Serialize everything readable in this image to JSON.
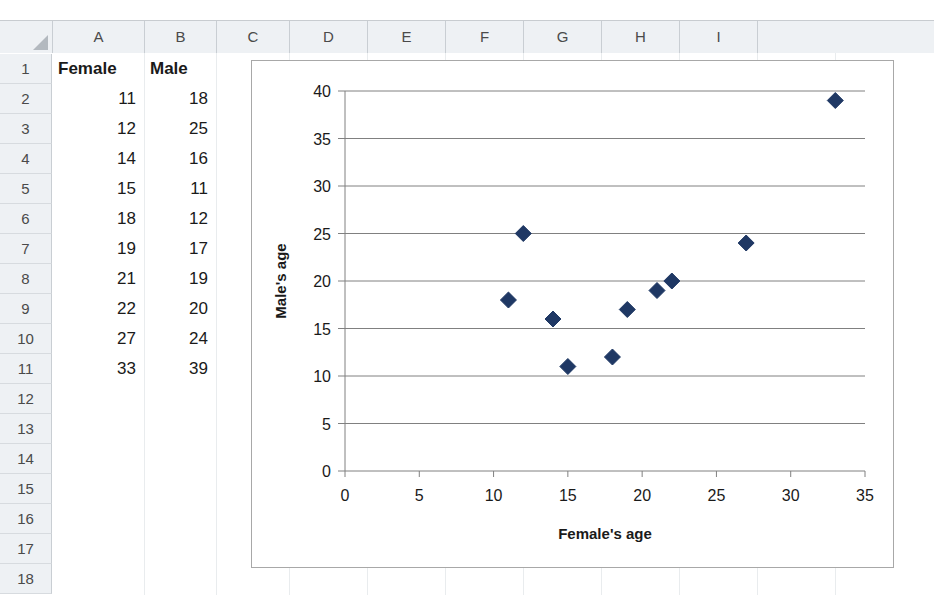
{
  "app": {
    "type": "spreadsheet-with-chart"
  },
  "sheet": {
    "column_headers": [
      "A",
      "B",
      "C",
      "D",
      "E",
      "F",
      "G",
      "H",
      "I"
    ],
    "row_headers": [
      "1",
      "2",
      "3",
      "4",
      "5",
      "6",
      "7",
      "8",
      "9",
      "10",
      "11",
      "12",
      "13",
      "14",
      "15",
      "16",
      "17",
      "18"
    ],
    "header_cells": {
      "a1": "Female",
      "b1": "Male"
    },
    "column_a": [
      "11",
      "12",
      "14",
      "15",
      "18",
      "19",
      "21",
      "22",
      "27",
      "33"
    ],
    "column_b": [
      "18",
      "25",
      "16",
      "11",
      "12",
      "17",
      "19",
      "20",
      "24",
      "39"
    ],
    "colors": {
      "header_fill": "#eef1f4",
      "header_text": "#4a4a4a",
      "grid_line": "#e9ecee",
      "cell_text": "#1a1a1a"
    }
  },
  "chart_data": {
    "type": "scatter",
    "title": "",
    "xlabel": "Female's age",
    "ylabel": "Male's age",
    "xlim": [
      0,
      35
    ],
    "ylim": [
      0,
      40
    ],
    "xticks": [
      0,
      5,
      10,
      15,
      20,
      25,
      30,
      35
    ],
    "yticks": [
      0,
      5,
      10,
      15,
      20,
      25,
      30,
      35,
      40
    ],
    "grid": "horizontal",
    "legend": "none",
    "marker": "diamond",
    "marker_color": "#1f3864",
    "series": [
      {
        "name": "Male's age vs Female's age",
        "points": [
          {
            "x": 11,
            "y": 18
          },
          {
            "x": 12,
            "y": 25
          },
          {
            "x": 14,
            "y": 16
          },
          {
            "x": 15,
            "y": 11
          },
          {
            "x": 18,
            "y": 12
          },
          {
            "x": 19,
            "y": 17
          },
          {
            "x": 21,
            "y": 19
          },
          {
            "x": 22,
            "y": 20
          },
          {
            "x": 27,
            "y": 24
          },
          {
            "x": 33,
            "y": 39
          }
        ]
      }
    ]
  }
}
